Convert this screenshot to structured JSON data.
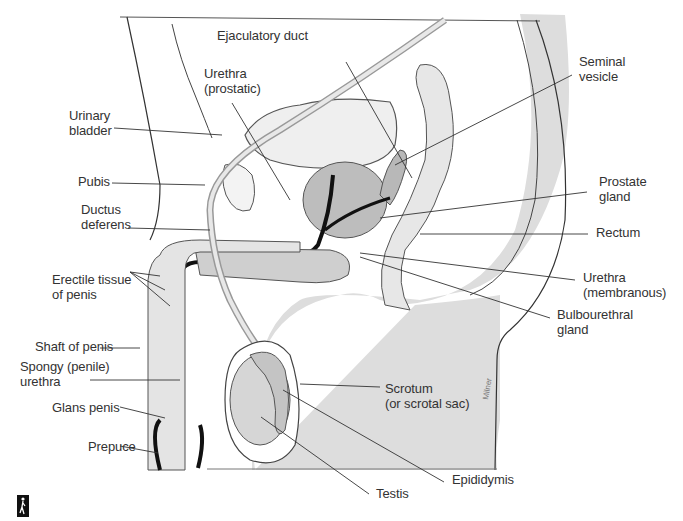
{
  "figure": {
    "title": "",
    "artist_signature": "Milner",
    "colors": {
      "line": "#3a3a3a",
      "shading": "#dcdcdc",
      "tissue": "#c8c8c8",
      "duct": "#111111",
      "background": "#ffffff"
    },
    "labels": [
      {
        "id": "ejaculatory-duct",
        "text": "Ejaculatory duct",
        "x": 217,
        "y": 35
      },
      {
        "id": "urethra-prostatic",
        "text": "Urethra\n(prostatic)",
        "x": 204,
        "y": 70
      },
      {
        "id": "seminal-vesicle",
        "text": "Seminal\nvesicle",
        "x": 579,
        "y": 54
      },
      {
        "id": "urinary-bladder",
        "text": "Urinary\nbladder",
        "x": 69,
        "y": 108
      },
      {
        "id": "pubis",
        "text": "Pubis",
        "x": 78,
        "y": 174
      },
      {
        "id": "prostate-gland",
        "text": "Prostate\ngland",
        "x": 599,
        "y": 174
      },
      {
        "id": "ductus-deferens",
        "text": "Ductus\ndeferens",
        "x": 81,
        "y": 202
      },
      {
        "id": "rectum",
        "text": "Rectum",
        "x": 596,
        "y": 225
      },
      {
        "id": "erectile-tissue",
        "text": "Erectile tissue\nof penis",
        "x": 52,
        "y": 272
      },
      {
        "id": "urethra-membranous",
        "text": "Urethra\n(membranous)",
        "x": 583,
        "y": 270
      },
      {
        "id": "bulbourethral-gland",
        "text": "Bulbourethral\ngland",
        "x": 557,
        "y": 307
      },
      {
        "id": "shaft-of-penis",
        "text": "Shaft of penis",
        "x": 35,
        "y": 339
      },
      {
        "id": "spongy-urethra",
        "text": "Spongy (penile)\nurethra",
        "x": 20,
        "y": 359
      },
      {
        "id": "scrotum",
        "text": "Scrotum\n(or scrotal sac)",
        "x": 385,
        "y": 381
      },
      {
        "id": "glans-penis",
        "text": "Glans penis",
        "x": 52,
        "y": 400
      },
      {
        "id": "prepuce",
        "text": "Prepuce",
        "x": 88,
        "y": 439
      },
      {
        "id": "epididymis",
        "text": "Epididymis",
        "x": 452,
        "y": 472
      },
      {
        "id": "testis",
        "text": "Testis",
        "x": 376,
        "y": 486
      }
    ],
    "leaders": [
      [
        346,
        62,
        412,
        178
      ],
      [
        232,
        103,
        290,
        200
      ],
      [
        572,
        75,
        395,
        165
      ],
      [
        114,
        128,
        222,
        135
      ],
      [
        112,
        183,
        205,
        185
      ],
      [
        587,
        192,
        380,
        218
      ],
      [
        128,
        228,
        210,
        230
      ],
      [
        588,
        234,
        420,
        234
      ],
      [
        130,
        272,
        170,
        306
      ],
      [
        130,
        272,
        165,
        290
      ],
      [
        130,
        272,
        160,
        276
      ],
      [
        575,
        280,
        360,
        253
      ],
      [
        550,
        318,
        360,
        257
      ],
      [
        100,
        348,
        140,
        348
      ],
      [
        90,
        380,
        180,
        380
      ],
      [
        380,
        387,
        300,
        384
      ],
      [
        120,
        407,
        165,
        418
      ],
      [
        120,
        446,
        158,
        453
      ],
      [
        444,
        482,
        283,
        390
      ],
      [
        369,
        494,
        261,
        417
      ]
    ]
  },
  "brand_icon": {
    "name": "walking-figure-icon"
  }
}
